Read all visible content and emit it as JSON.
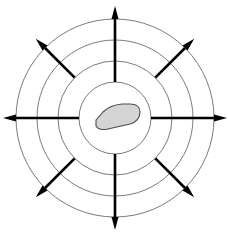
{
  "figure": {
    "name": "radial-dispersal-diagram",
    "width": 228,
    "height": 239,
    "background_color": "#ffffff"
  },
  "center": {
    "x": 115,
    "y": 118
  },
  "colors": {
    "ring_stroke": "#6b6b6b",
    "arrow_stroke": "#000000",
    "blob_fill": "#d4d4d4",
    "blob_stroke": "#4a4a4a",
    "background": "#ffffff"
  },
  "rings": {
    "count": 4,
    "stroke_width": 0.9,
    "items": [
      {
        "label": "ring-1-innermost",
        "radius": 36
      },
      {
        "label": "ring-2",
        "radius": 57
      },
      {
        "label": "ring-3",
        "radius": 78
      },
      {
        "label": "ring-4-outermost",
        "radius": 99
      }
    ]
  },
  "arrows": {
    "count": 8,
    "stroke_width": 2.6,
    "head_length": 13,
    "head_width": 7,
    "items": [
      {
        "label": "arrow-north",
        "direction": "N",
        "angle_deg": 270,
        "start_radius": 36,
        "end_radius": 112
      },
      {
        "label": "arrow-northeast",
        "direction": "NE",
        "angle_deg": 315,
        "start_radius": 57,
        "end_radius": 112
      },
      {
        "label": "arrow-east",
        "direction": "E",
        "angle_deg": 0,
        "start_radius": 36,
        "end_radius": 112
      },
      {
        "label": "arrow-southeast",
        "direction": "SE",
        "angle_deg": 45,
        "start_radius": 57,
        "end_radius": 112
      },
      {
        "label": "arrow-south",
        "direction": "S",
        "angle_deg": 90,
        "start_radius": 36,
        "end_radius": 112
      },
      {
        "label": "arrow-southwest",
        "direction": "SW",
        "angle_deg": 135,
        "start_radius": 57,
        "end_radius": 112
      },
      {
        "label": "arrow-west",
        "direction": "W",
        "angle_deg": 180,
        "start_radius": 36,
        "end_radius": 112
      },
      {
        "label": "arrow-northwest",
        "direction": "NW",
        "angle_deg": 225,
        "start_radius": 57,
        "end_radius": 112
      }
    ]
  },
  "center_object": {
    "label": "central-blob",
    "shape": "wedge-teardrop",
    "fill": "#d4d4d4",
    "stroke": "#4a4a4a",
    "stroke_width": 1.1,
    "path": "M 96 120 L 103 112 Q 110 105 122 104 L 130 104 Q 140 104 140 112 Q 140 121 130 124 L 108 129 Q 99 131 96 126 Z"
  },
  "labels": {
    "title": "",
    "caption": "",
    "annotations": []
  }
}
